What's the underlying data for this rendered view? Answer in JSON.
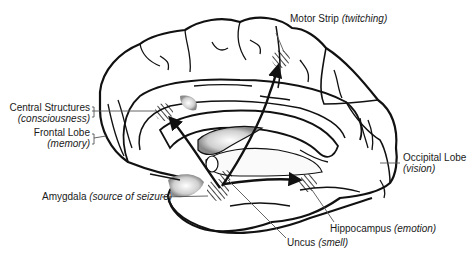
{
  "diagram": {
    "colors": {
      "outline": "#111111",
      "label_text": "#1a1a1a",
      "leader_line": "#555555",
      "background": "#ffffff"
    },
    "labels": {
      "motor_strip": {
        "name": "Motor Strip",
        "function": "(twitching)"
      },
      "central_structures": {
        "name": "Central Structures",
        "function": "(consciousness)"
      },
      "frontal_lobe": {
        "name": "Frontal Lobe",
        "function": "(memory)"
      },
      "occipital_lobe": {
        "name": "Occipital Lobe",
        "function": "(vision)"
      },
      "amygdala": {
        "name": "Amygdala",
        "function": "(source of seizure)"
      },
      "hippocampus": {
        "name": "Hippocampus",
        "function": "(emotion)"
      },
      "uncus": {
        "name": "Uncus",
        "function": "(smell)"
      }
    },
    "arrows": [
      {
        "from": "amygdala",
        "to": "central_structures"
      },
      {
        "from": "amygdala",
        "to": "motor_strip"
      },
      {
        "from": "amygdala",
        "to": "hippocampus"
      }
    ]
  }
}
